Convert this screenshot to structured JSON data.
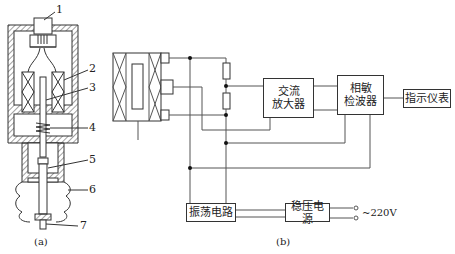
{
  "figure_a": {
    "part_labels": [
      "1",
      "2",
      "3",
      "4",
      "5",
      "6",
      "7"
    ],
    "caption": "(a)"
  },
  "figure_b": {
    "blocks": {
      "ac_amplifier": "交流\n放大器",
      "ac_amplifier_l1": "交流",
      "ac_amplifier_l2": "放大器",
      "phase_detector_l1": "相敏",
      "phase_detector_l2": "检波器",
      "indicator": "指示仪表",
      "oscillator": "振荡电路",
      "regulated_supply": "稳压电源"
    },
    "supply_label": "~220V",
    "caption": "(b)"
  }
}
